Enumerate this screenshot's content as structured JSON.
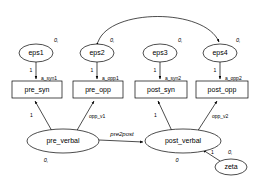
{
  "diagram": {
    "type": "sem-path-diagram",
    "title": "",
    "background_color": "#ffffff",
    "stroke_color": "#000000"
  },
  "error_terms": [
    {
      "id": "eps1",
      "label": "eps1",
      "mean_param": "0,",
      "cx": 36,
      "cy": 53,
      "rx": 17,
      "ry": 9
    },
    {
      "id": "eps2",
      "label": "eps2",
      "mean_param": "0,",
      "cx": 97,
      "cy": 53,
      "rx": 17,
      "ry": 9
    },
    {
      "id": "eps3",
      "label": "eps3",
      "mean_param": "0,",
      "cx": 160,
      "cy": 53,
      "rx": 17,
      "ry": 9
    },
    {
      "id": "eps4",
      "label": "eps4",
      "mean_param": "0,",
      "cx": 220,
      "cy": 53,
      "rx": 17,
      "ry": 9
    }
  ],
  "observed_variables": [
    {
      "id": "pre_syn",
      "label": "pre_syn",
      "x": 12,
      "y": 81,
      "w": 50,
      "h": 17
    },
    {
      "id": "pre_opp",
      "label": "pre_opp",
      "x": 73,
      "y": 81,
      "w": 50,
      "h": 17
    },
    {
      "id": "post_syn",
      "label": "post_syn",
      "x": 135,
      "y": 81,
      "w": 52,
      "h": 17
    },
    {
      "id": "post_opp",
      "label": "post_opp",
      "x": 196,
      "y": 81,
      "w": 52,
      "h": 17
    }
  ],
  "latent_variables": [
    {
      "id": "pre_verbal",
      "label": "pre_verbal",
      "mean_param": "0,",
      "cx": 63,
      "cy": 141,
      "rx": 36,
      "ry": 12
    },
    {
      "id": "post_verbal",
      "label": "post_verbal",
      "mean_param": "0",
      "cx": 183,
      "cy": 141,
      "rx": 38,
      "ry": 12
    }
  ],
  "disturbance_terms": [
    {
      "id": "zeta",
      "label": "zeta",
      "mean_param": "0,",
      "loading": "1",
      "cx": 231,
      "cy": 167,
      "rx": 16,
      "ry": 8
    }
  ],
  "error_loadings": [
    {
      "from": "eps1",
      "to": "pre_syn",
      "label": "1",
      "variance_label": "a_syn1"
    },
    {
      "from": "eps2",
      "to": "pre_opp",
      "label": "1",
      "variance_label": "a_opp1"
    },
    {
      "from": "eps3",
      "to": "post_syn",
      "label": "1",
      "variance_label": "a_syn2"
    },
    {
      "from": "eps4",
      "to": "post_opp",
      "label": "1",
      "variance_label": "a_opp2"
    }
  ],
  "factor_loadings": [
    {
      "from": "pre_verbal",
      "to": "pre_syn",
      "label": "1"
    },
    {
      "from": "pre_verbal",
      "to": "pre_opp",
      "label": "opp_v1"
    },
    {
      "from": "post_verbal",
      "to": "post_syn",
      "label": "1"
    },
    {
      "from": "post_verbal",
      "to": "post_opp",
      "label": "opp_v2"
    }
  ],
  "structural_paths": [
    {
      "from": "pre_verbal",
      "to": "post_verbal",
      "label": "pre2post"
    }
  ],
  "covariances": [
    {
      "from": "eps2",
      "to": "eps4",
      "label": "",
      "style": "double-headed-arc"
    }
  ]
}
